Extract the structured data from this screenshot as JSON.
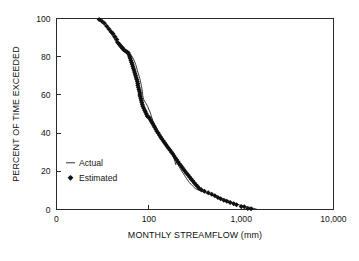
{
  "chart_data": {
    "type": "line",
    "title": "",
    "xlabel": "MONTHLY STREAMFLOW (mm)",
    "ylabel": "PERCENT OF TIME EXCEEDED",
    "xscale": "log",
    "yscale": "linear",
    "xlim": [
      10,
      10000
    ],
    "ylim": [
      0,
      100
    ],
    "grid": false,
    "x_tick_labels": [
      "0",
      "100",
      "1,000",
      "10,000"
    ],
    "x_tick_values": [
      10,
      100,
      1000,
      10000
    ],
    "y_tick_labels": [
      "0",
      "20",
      "40",
      "60",
      "80",
      "100"
    ],
    "y_tick_values": [
      0,
      20,
      40,
      60,
      80,
      100
    ],
    "legend_position": "center-left",
    "series": [
      {
        "name": "Actual",
        "marker": "none",
        "style": "line",
        "points": [
          [
            30,
            99.0
          ],
          [
            33,
            97.0
          ],
          [
            36,
            94.5
          ],
          [
            39,
            92.0
          ],
          [
            42,
            89.5
          ],
          [
            45,
            87.0
          ],
          [
            48,
            85.0
          ],
          [
            52,
            83.0
          ],
          [
            56,
            82.3
          ],
          [
            60,
            81.8
          ],
          [
            64,
            81.0
          ],
          [
            68,
            79.0
          ],
          [
            72,
            76.0
          ],
          [
            76,
            72.0
          ],
          [
            80,
            68.5
          ],
          [
            83,
            65.0
          ],
          [
            85,
            62.0
          ],
          [
            86,
            59.5
          ],
          [
            88,
            57.5
          ],
          [
            92,
            56.0
          ],
          [
            97,
            54.0
          ],
          [
            103,
            51.0
          ],
          [
            108,
            48.0
          ],
          [
            113,
            45.0
          ],
          [
            118,
            42.5
          ],
          [
            124,
            40.0
          ],
          [
            131,
            38.0
          ],
          [
            139,
            36.0
          ],
          [
            148,
            34.0
          ],
          [
            158,
            32.5
          ],
          [
            168,
            31.5
          ],
          [
            178,
            30.0
          ],
          [
            186,
            27.5
          ],
          [
            192,
            25.0
          ],
          [
            196,
            23.5
          ],
          [
            199,
            25.0
          ],
          [
            205,
            24.0
          ],
          [
            215,
            22.0
          ],
          [
            228,
            20.0
          ],
          [
            242,
            18.0
          ],
          [
            258,
            16.0
          ],
          [
            276,
            14.0
          ],
          [
            296,
            12.5
          ],
          [
            318,
            11.0
          ],
          [
            345,
            10.2
          ],
          [
            380,
            9.4
          ],
          [
            420,
            8.6
          ],
          [
            465,
            7.8
          ],
          [
            515,
            7.0
          ],
          [
            570,
            6.2
          ],
          [
            630,
            5.5
          ],
          [
            700,
            4.8
          ],
          [
            780,
            4.0
          ],
          [
            870,
            3.2
          ],
          [
            960,
            2.4
          ],
          [
            1060,
            1.8
          ],
          [
            1170,
            1.3
          ],
          [
            1290,
            0.9
          ],
          [
            1420,
            0.4
          ],
          [
            1500,
            0.0
          ]
        ]
      },
      {
        "name": "Estimated",
        "marker": "diamond",
        "style": "markers",
        "points": [
          [
            29,
            99.5
          ],
          [
            31,
            98.5
          ],
          [
            33,
            97.5
          ],
          [
            35,
            96.0
          ],
          [
            37,
            94.5
          ],
          [
            39,
            93.0
          ],
          [
            41,
            92.0
          ],
          [
            43,
            90.5
          ],
          [
            45,
            89.0
          ],
          [
            46,
            87.5
          ],
          [
            48,
            86.5
          ],
          [
            50,
            85.5
          ],
          [
            52,
            84.5
          ],
          [
            54,
            83.5
          ],
          [
            56,
            83.0
          ],
          [
            58,
            82.5
          ],
          [
            60,
            82.0
          ],
          [
            61,
            81.0
          ],
          [
            62,
            80.0
          ],
          [
            63,
            79.0
          ],
          [
            64,
            78.0
          ],
          [
            65,
            77.0
          ],
          [
            66,
            76.0
          ],
          [
            67,
            75.0
          ],
          [
            68,
            74.0
          ],
          [
            69,
            73.0
          ],
          [
            70,
            72.0
          ],
          [
            71,
            71.0
          ],
          [
            72,
            70.0
          ],
          [
            73,
            69.0
          ],
          [
            74,
            68.0
          ],
          [
            75,
            67.0
          ],
          [
            76,
            66.0
          ],
          [
            76,
            65.0
          ],
          [
            77,
            64.0
          ],
          [
            78,
            63.0
          ],
          [
            79,
            62.0
          ],
          [
            80,
            61.0
          ],
          [
            80,
            60.0
          ],
          [
            81,
            59.0
          ],
          [
            82,
            58.0
          ],
          [
            83,
            57.0
          ],
          [
            84,
            56.0
          ],
          [
            85,
            55.0
          ],
          [
            86,
            54.0
          ],
          [
            88,
            53.0
          ],
          [
            90,
            52.0
          ],
          [
            92,
            51.0
          ],
          [
            94,
            50.0
          ],
          [
            96,
            49.0
          ],
          [
            98,
            48.5
          ],
          [
            101,
            48.0
          ],
          [
            104,
            47.0
          ],
          [
            107,
            46.0
          ],
          [
            110,
            45.0
          ],
          [
            113,
            44.0
          ],
          [
            116,
            43.0
          ],
          [
            119,
            42.0
          ],
          [
            122,
            41.0
          ],
          [
            126,
            40.0
          ],
          [
            130,
            39.0
          ],
          [
            134,
            38.0
          ],
          [
            138,
            37.0
          ],
          [
            143,
            36.0
          ],
          [
            148,
            35.0
          ],
          [
            153,
            34.0
          ],
          [
            158,
            33.0
          ],
          [
            164,
            32.0
          ],
          [
            170,
            31.0
          ],
          [
            176,
            30.0
          ],
          [
            182,
            29.0
          ],
          [
            188,
            28.0
          ],
          [
            194,
            27.0
          ],
          [
            200,
            26.0
          ],
          [
            207,
            25.0
          ],
          [
            214,
            24.0
          ],
          [
            222,
            23.0
          ],
          [
            230,
            22.0
          ],
          [
            238,
            21.0
          ],
          [
            247,
            20.0
          ],
          [
            256,
            19.0
          ],
          [
            266,
            18.0
          ],
          [
            276,
            17.0
          ],
          [
            287,
            16.0
          ],
          [
            298,
            15.0
          ],
          [
            310,
            14.0
          ],
          [
            323,
            13.0
          ],
          [
            337,
            12.0
          ],
          [
            352,
            11.0
          ],
          [
            370,
            10.3
          ],
          [
            400,
            9.6
          ],
          [
            440,
            8.8
          ],
          [
            480,
            8.0
          ],
          [
            520,
            7.2
          ],
          [
            560,
            6.3
          ],
          [
            600,
            5.6
          ],
          [
            650,
            4.9
          ],
          [
            700,
            4.3
          ],
          [
            760,
            3.7
          ],
          [
            830,
            3.0
          ],
          [
            890,
            2.5
          ],
          [
            1000,
            1.6
          ],
          [
            1080,
            1.4
          ],
          [
            1180,
            0.5
          ],
          [
            1280,
            0.4
          ]
        ]
      }
    ]
  },
  "legend": {
    "entries": [
      {
        "label": "Actual",
        "symbol": "line"
      },
      {
        "label": "Estimated",
        "symbol": "diamond"
      }
    ]
  }
}
